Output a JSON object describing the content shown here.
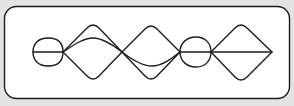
{
  "diagram": {
    "type": "knot-like curve graph",
    "background_color": "#e3e3e3",
    "panel_color": "#ffffff",
    "stroke_color": "#1c1c1c",
    "frame": {
      "x": 4,
      "y": 6,
      "width": 286,
      "height": 93,
      "radius": 12
    },
    "nodes": [
      {
        "id": "A",
        "x": 63,
        "y": 52
      },
      {
        "id": "B",
        "x": 122,
        "y": 52
      },
      {
        "id": "C",
        "x": 180,
        "y": 52
      },
      {
        "id": "D",
        "x": 211,
        "y": 52
      },
      {
        "id": "E",
        "x": 272,
        "y": 52
      }
    ],
    "shapes": [
      {
        "name": "left-loop",
        "kind": "ellipse",
        "cx": 48,
        "cy": 52,
        "rx": 15,
        "ry": 14,
        "with_axis_line": true
      },
      {
        "name": "lens-AB",
        "kind": "three-curve lens",
        "from": "A",
        "to": "B",
        "top_y": 24,
        "mid_y": 39,
        "bottom_y": 79
      },
      {
        "name": "lens-BC",
        "kind": "three-curve lens",
        "from": "B",
        "to": "C",
        "top_y": 25,
        "mid_y": 66,
        "bottom_y": 80
      },
      {
        "name": "middle-loop",
        "kind": "ellipse",
        "cx": 196,
        "cy": 52,
        "rx": 15,
        "ry": 15,
        "with_axis_line": true
      },
      {
        "name": "right-diamond",
        "kind": "diamond",
        "from": "D",
        "to": "E",
        "top_y": 24,
        "bottom_y": 81,
        "with_axis_line": true
      }
    ]
  }
}
